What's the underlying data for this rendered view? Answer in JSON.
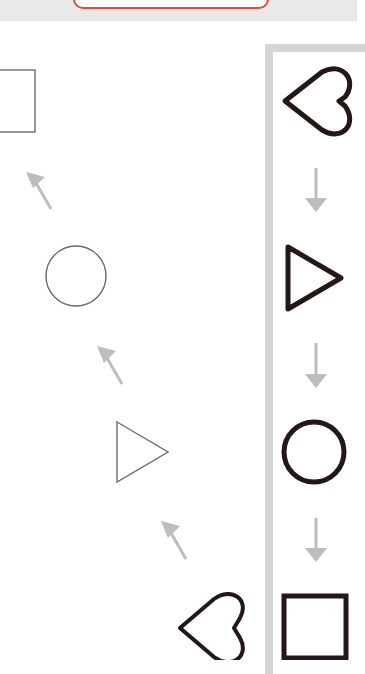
{
  "header": {
    "button_label": "",
    "accent_color": "#e24a3d",
    "bar_color": "#e9e9e9"
  },
  "left_sequence": {
    "description": "Diagonal sequence of thin gray outlined shapes connected by up-left arrows",
    "items": [
      {
        "shape": "square",
        "style": "thin-outline"
      },
      {
        "shape": "arrow-up-left"
      },
      {
        "shape": "circle",
        "style": "thin-outline"
      },
      {
        "shape": "arrow-up-left"
      },
      {
        "shape": "triangle-right",
        "style": "thin-outline"
      },
      {
        "shape": "arrow-up-left"
      },
      {
        "shape": "heart-left",
        "style": "bold-outline"
      }
    ],
    "stroke_color": "#6b6b6b",
    "arrow_color": "#bdbdbd"
  },
  "right_panel": {
    "description": "Vertical sequence of bold black outlined shapes connected by down arrows",
    "items": [
      {
        "shape": "heart-left"
      },
      {
        "shape": "arrow-down"
      },
      {
        "shape": "triangle-right"
      },
      {
        "shape": "arrow-down"
      },
      {
        "shape": "circle"
      },
      {
        "shape": "arrow-down"
      },
      {
        "shape": "square"
      }
    ],
    "stroke_color": "#231815",
    "arrow_color": "#bdbdbd",
    "border_color": "#d4d4d4"
  }
}
